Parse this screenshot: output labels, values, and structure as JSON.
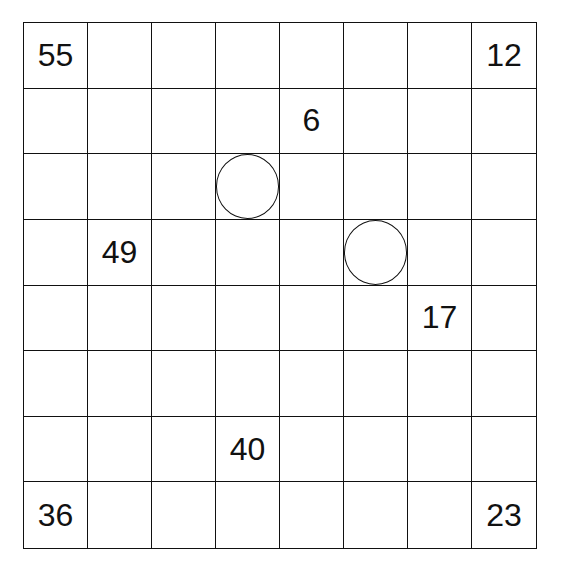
{
  "puzzle": {
    "rows": 8,
    "cols": 8,
    "clues": [
      {
        "row": 0,
        "col": 0,
        "value": "55"
      },
      {
        "row": 0,
        "col": 7,
        "value": "12"
      },
      {
        "row": 1,
        "col": 4,
        "value": "6"
      },
      {
        "row": 3,
        "col": 1,
        "value": "49"
      },
      {
        "row": 4,
        "col": 6,
        "value": "17"
      },
      {
        "row": 6,
        "col": 3,
        "value": "40"
      },
      {
        "row": 7,
        "col": 0,
        "value": "36"
      },
      {
        "row": 7,
        "col": 7,
        "value": "23"
      }
    ],
    "circles": [
      {
        "row": 2,
        "col": 3
      },
      {
        "row": 3,
        "col": 5
      }
    ]
  }
}
